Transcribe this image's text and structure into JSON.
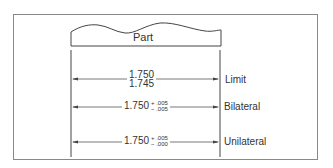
{
  "diagram": {
    "part_label": "Part",
    "rows": [
      {
        "label": "Limit",
        "upper": "1.750",
        "lower": "1.745"
      },
      {
        "label": "Bilateral",
        "nominal": "1.750",
        "plus": "+ .005",
        "minus": "− .005"
      },
      {
        "label": "Unilateral",
        "nominal": "1.750",
        "plus": "+ .005",
        "minus": "− .000"
      }
    ]
  }
}
